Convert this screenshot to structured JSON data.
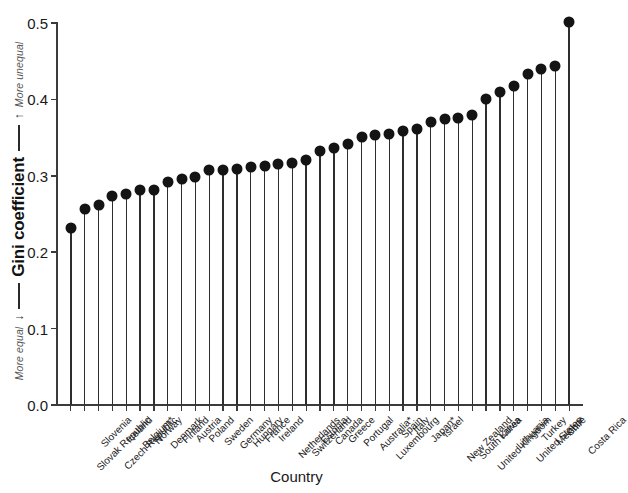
{
  "chart_data": {
    "type": "scatter",
    "subtype": "lollipop",
    "title": "",
    "xlabel": "Country",
    "ylabel": "Gini coefficient",
    "ylim": [
      0.0,
      0.5
    ],
    "yticks": [
      "0.0",
      "0.1",
      "0.2",
      "0.3",
      "0.4",
      "0.5"
    ],
    "ytick_values": [
      0.0,
      0.1,
      0.2,
      0.3,
      0.4,
      0.5
    ],
    "grid": false,
    "legend": null,
    "axis_annotations": {
      "top_note": "More unequal",
      "top_arrow": "↑",
      "bottom_note": "More equal",
      "bottom_arrow": "↓"
    },
    "marker_color": "#141414",
    "stem_color": "#2e2e2e",
    "categories": [
      "Slovak Republic",
      "Slovenia",
      "Czech Republic",
      "Iceland",
      "Belgium*",
      "Norway",
      "Denmark",
      "Finland",
      "Austria",
      "Poland",
      "Sweden",
      "Germany",
      "Hungary",
      "France",
      "Ireland",
      "Netherlands",
      "Switzerland",
      "Estonia",
      "Canada",
      "Greece",
      "Portugal",
      "Australia*",
      "Luxembourg",
      "Spain",
      "Italy",
      "Japan*",
      "Israel",
      "New Zealand",
      "South Korea",
      "United Kingdom",
      "Latvia",
      "Lithuania",
      "United States",
      "Turkey",
      "Mexico*",
      "Chile",
      "Costa Rica"
    ],
    "values": [
      0.232,
      0.257,
      0.262,
      0.273,
      0.276,
      0.281,
      0.282,
      0.292,
      0.296,
      0.298,
      0.307,
      0.308,
      0.309,
      0.311,
      0.313,
      0.316,
      0.317,
      0.321,
      0.332,
      0.336,
      0.342,
      0.351,
      0.353,
      0.355,
      0.358,
      0.361,
      0.371,
      0.374,
      0.376,
      0.379,
      0.401,
      0.41,
      0.418,
      0.433,
      0.44,
      0.444,
      0.501
    ]
  }
}
